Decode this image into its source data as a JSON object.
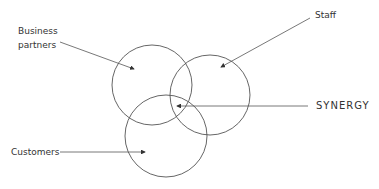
{
  "diagram": {
    "labels": {
      "business_partners_line1": "Business",
      "business_partners_line2": "partners",
      "staff": "Staff",
      "synergy": "SYNERGY",
      "customers": "Customers"
    },
    "circles": [
      {
        "name": "business-partners",
        "cx": 152,
        "cy": 85,
        "r": 40
      },
      {
        "name": "staff",
        "cx": 210,
        "cy": 95,
        "r": 40
      },
      {
        "name": "customers",
        "cx": 166,
        "cy": 136,
        "r": 41
      }
    ],
    "colors": {
      "stroke": "#555555",
      "text": "#333333"
    }
  }
}
